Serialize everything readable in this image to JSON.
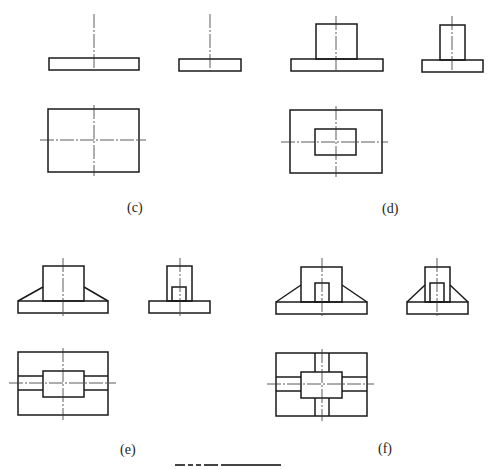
{
  "figure": {
    "panels": [
      {
        "id": "c",
        "label": "(c)",
        "description": "Flat rectangular plate: front view, side view, top view"
      },
      {
        "id": "d",
        "label": "(d)",
        "description": "Plate with rectangular boss on top: front, side, top views"
      },
      {
        "id": "e",
        "label": "(e)",
        "description": "Plate with boss and two triangular ribs (left/right), slot in side view"
      },
      {
        "id": "f",
        "label": "(f)",
        "description": "Plate with boss, ribs on all four sides, slot in front and side views"
      }
    ],
    "caption": "图 (caption partially cut off)"
  },
  "colors": {
    "line": "#1a1a1a",
    "background": "#ffffff"
  }
}
